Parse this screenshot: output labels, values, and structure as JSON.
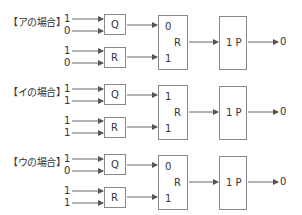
{
  "cases": [
    {
      "label": "【アの場合】",
      "q_inputs": [
        "1",
        "0"
      ],
      "r_inputs": [
        "1",
        "0"
      ],
      "q_gate": "Q",
      "r_gate": "R",
      "mid_gate": {
        "label": "R",
        "top_input": "0",
        "bottom_input": "1"
      },
      "final_gate": "1 P",
      "output": "0"
    },
    {
      "label": "【イの場合】",
      "q_inputs": [
        "1",
        "1"
      ],
      "r_inputs": [
        "1",
        "1"
      ],
      "q_gate": "Q",
      "r_gate": "R",
      "mid_gate": {
        "label": "R",
        "top_input": "1",
        "bottom_input": "1"
      },
      "final_gate": "1 P",
      "output": "0"
    },
    {
      "label": "【ウの場合】",
      "q_inputs": [
        "1",
        "0"
      ],
      "r_inputs": [
        "1",
        "1"
      ],
      "q_gate": "Q",
      "r_gate": "R",
      "mid_gate": {
        "label": "R",
        "top_input": "0",
        "bottom_input": "1"
      },
      "final_gate": "1 P",
      "output": "0"
    }
  ],
  "colors": {
    "line": "#666666",
    "box_border": "#888888",
    "text": "#333333"
  }
}
